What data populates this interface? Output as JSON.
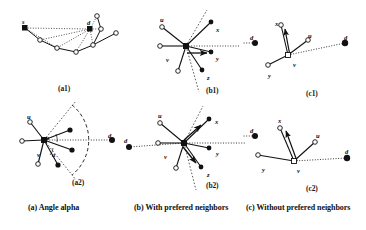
{
  "figure": {
    "title_alt": "Angle alpha and prefered neighbors routing figure",
    "background": "#ffffff",
    "ink": "#111111"
  },
  "captions": [
    {
      "id": "cap-a",
      "text": "(a) Angle alpha",
      "x": 28
    },
    {
      "id": "cap-b",
      "text": "(b) With prefered neighbors",
      "x": 134
    },
    {
      "id": "cap-c",
      "text": "(c) Without prefered neighbors",
      "x": 246
    }
  ],
  "sublabels": [
    {
      "id": "a1",
      "text": "(a1)",
      "x": 58,
      "y": 84
    },
    {
      "id": "a2",
      "text": "(a2)",
      "x": 72,
      "y": 178
    },
    {
      "id": "b1",
      "text": "(b1)",
      "x": 206,
      "y": 86
    },
    {
      "id": "b2",
      "text": "(b2)",
      "x": 206,
      "y": 181
    },
    {
      "id": "c1",
      "text": "(c1)",
      "x": 306,
      "y": 89
    },
    {
      "id": "c2",
      "text": "(c2)",
      "x": 306,
      "y": 184
    }
  ],
  "node_labels": [
    {
      "id": "a1-s",
      "text": "s",
      "x": 22,
      "y": 19
    },
    {
      "id": "a1-d",
      "text": "d",
      "x": 87,
      "y": 20
    },
    {
      "id": "a2-u",
      "text": "u",
      "x": 27,
      "y": 114
    },
    {
      "id": "a2-v",
      "text": "v",
      "x": 37,
      "y": 152
    },
    {
      "id": "a2-alpha1",
      "text": "a",
      "x": 46,
      "y": 135
    },
    {
      "id": "a2-alpha2",
      "text": "a",
      "x": 52,
      "y": 152
    },
    {
      "id": "a2-d",
      "text": "d",
      "x": 108,
      "y": 133
    },
    {
      "id": "b1-u",
      "text": "u",
      "x": 160,
      "y": 17
    },
    {
      "id": "b1-x",
      "text": "x",
      "x": 216,
      "y": 27
    },
    {
      "id": "b1-v",
      "text": "v",
      "x": 166,
      "y": 57
    },
    {
      "id": "b1-y",
      "text": "y",
      "x": 216,
      "y": 56
    },
    {
      "id": "b1-z",
      "text": "z",
      "x": 207,
      "y": 75
    },
    {
      "id": "b2-u",
      "text": "u",
      "x": 158,
      "y": 113
    },
    {
      "id": "b2-x",
      "text": "x",
      "x": 215,
      "y": 119
    },
    {
      "id": "b2-d",
      "text": "d",
      "x": 124,
      "y": 138
    },
    {
      "id": "b2-v",
      "text": "v",
      "x": 164,
      "y": 154
    },
    {
      "id": "b2-y",
      "text": "y",
      "x": 216,
      "y": 151
    },
    {
      "id": "b2-z",
      "text": "z",
      "x": 207,
      "y": 172
    },
    {
      "id": "c1-x",
      "text": "x",
      "x": 275,
      "y": 21
    },
    {
      "id": "c1-u",
      "text": "u",
      "x": 308,
      "y": 33
    },
    {
      "id": "c1-d-left",
      "text": "d",
      "x": 250,
      "y": 35
    },
    {
      "id": "c1-d-right",
      "text": "d",
      "x": 344,
      "y": 35
    },
    {
      "id": "c1-v",
      "text": "v",
      "x": 293,
      "y": 62
    },
    {
      "id": "c1-y",
      "text": "y",
      "x": 268,
      "y": 73
    },
    {
      "id": "c2-x",
      "text": "x",
      "x": 278,
      "y": 118
    },
    {
      "id": "c2-d-left",
      "text": "d",
      "x": 250,
      "y": 128
    },
    {
      "id": "c2-u",
      "text": "u",
      "x": 316,
      "y": 133
    },
    {
      "id": "c2-d-right",
      "text": "d",
      "x": 345,
      "y": 149
    },
    {
      "id": "c2-y",
      "text": "y",
      "x": 262,
      "y": 167
    },
    {
      "id": "c2-v",
      "text": "v",
      "x": 297,
      "y": 168
    }
  ],
  "chart_data": {
    "type": "diagram",
    "panels": [
      {
        "id": "a1",
        "label": "(a1)",
        "description": "Source s routes to destination d along a chain of relay nodes; dotted lines show direct geometric links from s and d.",
        "nodes": [
          {
            "name": "s",
            "x": 25,
            "y": 28,
            "style": "filled-square"
          },
          {
            "name": "d",
            "x": 90,
            "y": 29,
            "style": "filled-square"
          },
          {
            "name": "n1",
            "x": 40,
            "y": 40,
            "style": "open-circle"
          },
          {
            "name": "n2",
            "x": 57,
            "y": 48,
            "style": "open-circle"
          },
          {
            "name": "n3",
            "x": 76,
            "y": 52,
            "style": "open-circle"
          },
          {
            "name": "n4",
            "x": 93,
            "y": 45,
            "style": "open-circle"
          },
          {
            "name": "n5",
            "x": 101,
            "y": 29,
            "style": "open-circle"
          },
          {
            "name": "n6",
            "x": 97,
            "y": 16,
            "style": "open-circle"
          },
          {
            "name": "n7",
            "x": 116,
            "y": 33,
            "style": "open-circle"
          }
        ],
        "solid_edges": [
          [
            "s",
            "n1"
          ],
          [
            "n1",
            "n2"
          ],
          [
            "n2",
            "n3"
          ],
          [
            "n3",
            "n4"
          ],
          [
            "n4",
            "n5"
          ],
          [
            "n5",
            "n6"
          ]
        ],
        "dotted_edges": [
          [
            "s",
            "d"
          ],
          [
            "s",
            "n2"
          ],
          [
            "d",
            "n1"
          ],
          [
            "d",
            "n2"
          ],
          [
            "d",
            "n3"
          ],
          [
            "d",
            "n4"
          ],
          [
            "d",
            "n5"
          ],
          [
            "d",
            "n6"
          ]
        ]
      },
      {
        "id": "a2",
        "label": "(a2)",
        "description": "Zoom on node v: the dashed arc delimits the angular sector alpha around the direction v to d; neighbors inside the sector are prefered.",
        "nodes": [
          {
            "name": "v",
            "x": 44,
            "y": 140,
            "style": "filled-square"
          },
          {
            "name": "u",
            "x": 30,
            "y": 122,
            "style": "open-circle"
          },
          {
            "name": "w",
            "x": 22,
            "y": 141,
            "style": "open-circle"
          },
          {
            "name": "p1",
            "x": 38,
            "y": 164,
            "style": "open-circle"
          },
          {
            "name": "p2",
            "x": 70,
            "y": 130,
            "style": "filled-circle"
          },
          {
            "name": "p3",
            "x": 72,
            "y": 150,
            "style": "filled-circle"
          },
          {
            "name": "p4",
            "x": 58,
            "y": 165,
            "style": "filled-circle"
          },
          {
            "name": "d",
            "x": 112,
            "y": 140,
            "style": "filled-circle"
          }
        ],
        "solid_edges": [
          [
            "v",
            "u"
          ],
          [
            "v",
            "w"
          ],
          [
            "v",
            "p1"
          ],
          [
            "v",
            "p2"
          ],
          [
            "v",
            "p3"
          ],
          [
            "v",
            "p4"
          ]
        ],
        "dotted_edges": [
          [
            "v",
            "d"
          ]
        ],
        "arc": {
          "cx": 44,
          "cy": 140,
          "r": 45,
          "from_deg": -52,
          "to_deg": 52,
          "style": "dashed"
        },
        "sector_rays": [
          {
            "deg": -52
          },
          {
            "deg": 52
          }
        ],
        "angle_labels": [
          "a",
          "a"
        ]
      },
      {
        "id": "b1",
        "label": "(b1)",
        "description": "Node v with prefered neighbors; the forwarding arrow points toward y, the neighbor closest to the v-d line.",
        "nodes": [
          {
            "name": "v",
            "x": 186,
            "y": 46,
            "style": "filled-square"
          },
          {
            "name": "u",
            "x": 162,
            "y": 27,
            "style": "open-circle"
          },
          {
            "name": "w",
            "x": 160,
            "y": 46,
            "style": "open-circle"
          },
          {
            "name": "p1",
            "x": 178,
            "y": 71,
            "style": "open-circle"
          },
          {
            "name": "x",
            "x": 211,
            "y": 22,
            "style": "filled-circle"
          },
          {
            "name": "y",
            "x": 211,
            "y": 52,
            "style": "filled-circle"
          },
          {
            "name": "z",
            "x": 202,
            "y": 70,
            "style": "filled-circle"
          }
        ],
        "solid_edges": [
          [
            "v",
            "u"
          ],
          [
            "v",
            "w"
          ],
          [
            "v",
            "p1"
          ],
          [
            "v",
            "x"
          ],
          [
            "v",
            "y"
          ],
          [
            "v",
            "z"
          ]
        ],
        "dotted_edges": [
          [
            "v",
            "dline"
          ]
        ],
        "arrows": [
          {
            "from": "v",
            "to": "y"
          }
        ],
        "sector_rays": [
          {
            "deg": -58
          },
          {
            "deg": 58
          }
        ]
      },
      {
        "id": "b2",
        "label": "(b2)",
        "description": "Same neighborhood as b1 but destination d lies to the left; two candidate forwarding arrows point toward x and toward z.",
        "nodes": [
          {
            "name": "v",
            "x": 184,
            "y": 143,
            "style": "filled-square"
          },
          {
            "name": "u",
            "x": 160,
            "y": 123,
            "style": "open-circle"
          },
          {
            "name": "w",
            "x": 158,
            "y": 143,
            "style": "open-circle"
          },
          {
            "name": "p1",
            "x": 176,
            "y": 168,
            "style": "open-circle"
          },
          {
            "name": "x",
            "x": 209,
            "y": 119,
            "style": "filled-circle"
          },
          {
            "name": "y",
            "x": 209,
            "y": 148,
            "style": "filled-circle"
          },
          {
            "name": "z",
            "x": 201,
            "y": 167,
            "style": "filled-circle"
          },
          {
            "name": "d",
            "x": 129,
            "y": 147,
            "style": "filled-circle"
          }
        ],
        "solid_edges": [
          [
            "v",
            "u"
          ],
          [
            "v",
            "w"
          ],
          [
            "v",
            "p1"
          ],
          [
            "v",
            "x"
          ],
          [
            "v",
            "y"
          ],
          [
            "v",
            "z"
          ]
        ],
        "dotted_edges": [
          [
            "v",
            "d"
          ]
        ],
        "arrows": [
          {
            "from": "v",
            "to": "x"
          },
          {
            "from": "v",
            "to": "z"
          }
        ],
        "sector_rays": [
          {
            "deg": -60
          },
          {
            "deg": 62
          }
        ]
      },
      {
        "id": "c1",
        "label": "(c1)",
        "description": "Node v without prefered neighbors; forwarding arrow points back toward x, away from destination d.",
        "nodes": [
          {
            "name": "v",
            "x": 288,
            "y": 55,
            "style": "open-square"
          },
          {
            "name": "x",
            "x": 281,
            "y": 25,
            "style": "open-circle"
          },
          {
            "name": "u",
            "x": 308,
            "y": 40,
            "style": "open-circle"
          },
          {
            "name": "y",
            "x": 268,
            "y": 65,
            "style": "open-circle"
          },
          {
            "name": "d_left",
            "x": 255,
            "y": 43,
            "style": "filled-circle"
          },
          {
            "name": "d_right",
            "x": 345,
            "y": 43,
            "style": "filled-circle"
          }
        ],
        "solid_edges": [
          [
            "v",
            "x"
          ],
          [
            "v",
            "u"
          ],
          [
            "v",
            "y"
          ]
        ],
        "dotted_edges": [
          [
            "v",
            "d_right"
          ]
        ],
        "arrows": [
          {
            "from": "v",
            "to": "x"
          }
        ]
      },
      {
        "id": "c2",
        "label": "(c2)",
        "description": "Same configuration as c1 with a longer link to y; the forwarding arrow still points toward x.",
        "nodes": [
          {
            "name": "v",
            "x": 294,
            "y": 161,
            "style": "open-square"
          },
          {
            "name": "x",
            "x": 280,
            "y": 128,
            "style": "open-circle"
          },
          {
            "name": "u",
            "x": 315,
            "y": 142,
            "style": "open-circle"
          },
          {
            "name": "y",
            "x": 258,
            "y": 155,
            "style": "open-circle"
          },
          {
            "name": "d_left",
            "x": 255,
            "y": 136,
            "style": "filled-circle"
          },
          {
            "name": "d_right",
            "x": 347,
            "y": 158,
            "style": "filled-circle"
          }
        ],
        "solid_edges": [
          [
            "v",
            "x"
          ],
          [
            "v",
            "u"
          ],
          [
            "v",
            "y"
          ]
        ],
        "dotted_edges": [
          [
            "v",
            "d_right"
          ]
        ],
        "arrows": [
          {
            "from": "v",
            "to": "x"
          }
        ]
      }
    ]
  }
}
